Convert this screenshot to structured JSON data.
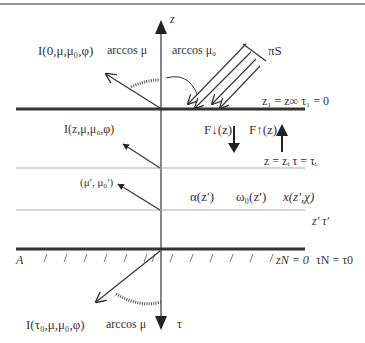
{
  "diagram": {
    "type": "radiative-transfer-plane-parallel-atmosphere",
    "axes": {
      "z_label": "z",
      "tau_label": "τ"
    },
    "top": {
      "radiance_label": "I(0,μ,μ₀,φ)",
      "zenith_angle_label": "arccos μ",
      "solar_angle_label": "arccos μ₀",
      "solar_flux_label": "πS",
      "boundary_label": "z₁ = z∞  τ₁ = 0"
    },
    "interior": {
      "radiance_label": "I(z,μ,μ₀,φ)",
      "flux_down_label": "F↓(z)",
      "flux_up_label": "F↑(z)",
      "level_label": "z = zᵢ  τ = τᵢ",
      "scatter_label": "(μ′, μ₀′)",
      "extinction_label": "α(z′)",
      "albedo_label": "ω₀(z′)",
      "phase_label": "x(z′,χ)",
      "layer_label": "z′   τ′"
    },
    "bottom": {
      "surface_albedo_label": "A",
      "boundary_label_z": "zN = 0",
      "boundary_label_tau": "τN = τ0",
      "radiance_label": "I(τ₀,μ,μ₀,φ)",
      "zenith_angle_label": "arccos μ"
    },
    "colors": {
      "line": "#333333",
      "thin_line": "#aaaaaa",
      "rule": "#999999"
    }
  }
}
